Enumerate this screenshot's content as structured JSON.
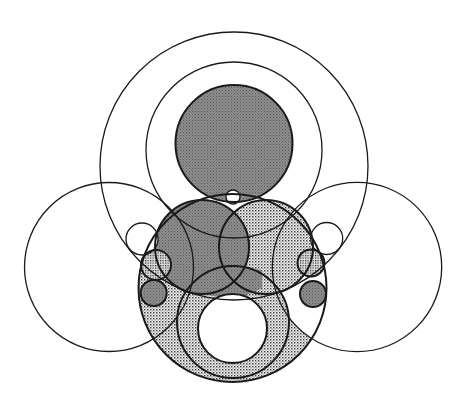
{
  "figure": {
    "width": 468,
    "height": 409,
    "colors": {
      "background": "#ffffff",
      "stroke": "#1a1a1a",
      "gray_fill": "#8a8a8a",
      "gray_dot": "#5e5e5e",
      "dotted_bg": "#ffffff",
      "dotted_dot": "#3a3a3a"
    },
    "circles": [
      {
        "id": "outer-top-large",
        "cx": 234,
        "cy": 166,
        "r": 134,
        "fill": "none",
        "stroke_width": 1.3
      },
      {
        "id": "inner-top-ring",
        "cx": 234,
        "cy": 150,
        "r": 88,
        "fill": "none",
        "stroke_width": 1.3
      },
      {
        "id": "top-dark",
        "cx": 234,
        "cy": 143.5,
        "r": 58.5,
        "fill": "gray",
        "stroke_width": 2
      },
      {
        "id": "left-large",
        "cx": 109,
        "cy": 267,
        "r": 84.5,
        "fill": "none",
        "stroke_width": 1.3
      },
      {
        "id": "right-large",
        "cx": 357,
        "cy": 267,
        "r": 84.7,
        "fill": "none",
        "stroke_width": 1.3
      },
      {
        "id": "bottom-large",
        "cx": 232.5,
        "cy": 288,
        "r": 94,
        "fill": "dotted",
        "stroke_width": 2
      },
      {
        "id": "bottom-ring",
        "cx": 233,
        "cy": 322,
        "r": 56,
        "fill": "none",
        "stroke_width": 2
      },
      {
        "id": "bottom-hole",
        "cx": 232.5,
        "cy": 328.5,
        "r": 34.5,
        "fill": "white",
        "stroke_width": 2
      },
      {
        "id": "mid-left",
        "cx": 202,
        "cy": 247,
        "r": 47,
        "fill": "gray",
        "stroke_width": 2
      },
      {
        "id": "mid-right",
        "cx": 266,
        "cy": 247,
        "r": 47,
        "fill": "dotted",
        "stroke_width": 2
      },
      {
        "id": "top-small",
        "cx": 233,
        "cy": 197,
        "r": 7,
        "fill": "white",
        "stroke_width": 1.3
      },
      {
        "id": "left-small-white",
        "cx": 142,
        "cy": 239,
        "r": 16,
        "fill": "none",
        "stroke_width": 1.3
      },
      {
        "id": "left-small-dotted",
        "cx": 156,
        "cy": 265,
        "r": 15,
        "fill": "dotted-dense",
        "stroke_width": 2
      },
      {
        "id": "left-small-gray",
        "cx": 153.7,
        "cy": 293,
        "r": 13,
        "fill": "gray",
        "stroke_width": 2
      },
      {
        "id": "right-small-white",
        "cx": 326.7,
        "cy": 238.5,
        "r": 16,
        "fill": "none",
        "stroke_width": 1.3
      },
      {
        "id": "right-small-dotted",
        "cx": 311,
        "cy": 263,
        "r": 13.5,
        "fill": "dotted-dense",
        "stroke_width": 2
      },
      {
        "id": "right-small-gray",
        "cx": 313,
        "cy": 294,
        "r": 13,
        "fill": "gray",
        "stroke_width": 2
      }
    ]
  }
}
